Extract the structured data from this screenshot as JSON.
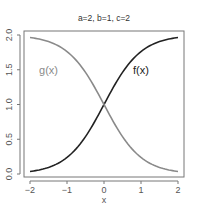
{
  "chart_data": {
    "type": "line",
    "title": "a=2, b=1, c=2",
    "xlabel": "x",
    "ylabel": "",
    "xlim": [
      -2,
      2
    ],
    "ylim": [
      0,
      2
    ],
    "x_ticks": [
      "-2",
      "-1",
      "0",
      "1",
      "2"
    ],
    "y_ticks": [
      "0.0",
      "0.5",
      "1.0",
      "1.5",
      "2.0"
    ],
    "grid": false,
    "legend": "inline labels",
    "annotations": [
      {
        "text": "g(x)",
        "x": -1.5,
        "y": 1.5,
        "color": "#8a8a8a"
      },
      {
        "text": "f(x)",
        "x": 1.0,
        "y": 1.5,
        "color": "#222222"
      }
    ],
    "series": [
      {
        "name": "f(x)",
        "color": "#222222",
        "x": [
          -2,
          -1.5,
          -1,
          -0.5,
          0,
          0.5,
          1,
          1.5,
          2
        ],
        "values": [
          0.036,
          0.095,
          0.238,
          0.538,
          1.0,
          1.462,
          1.762,
          1.905,
          1.964
        ]
      },
      {
        "name": "g(x)",
        "color": "#8a8a8a",
        "x": [
          -2,
          -1.5,
          -1,
          -0.5,
          0,
          0.5,
          1,
          1.5,
          2
        ],
        "values": [
          1.964,
          1.905,
          1.762,
          1.462,
          1.0,
          0.538,
          0.238,
          0.095,
          0.036
        ]
      }
    ]
  }
}
